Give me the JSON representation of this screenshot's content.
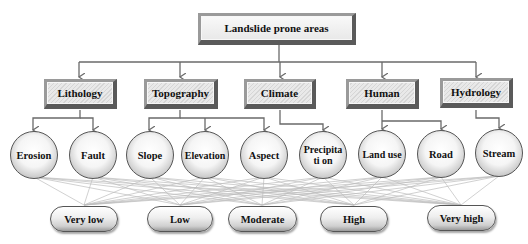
{
  "root": {
    "label": "Landslide prone areas"
  },
  "categories": [
    {
      "label": "Lithology"
    },
    {
      "label": "Topography"
    },
    {
      "label": "Climate"
    },
    {
      "label": "Human"
    },
    {
      "label": "Hydrology"
    }
  ],
  "factors": [
    {
      "label": "Erosion",
      "category": "Lithology"
    },
    {
      "label": "Fault",
      "category": "Lithology"
    },
    {
      "label": "Slope",
      "category": "Topography"
    },
    {
      "label": "Elevation",
      "category": "Topography"
    },
    {
      "label": "Aspect",
      "category": "Topography"
    },
    {
      "label": "Precipitati on",
      "category": "Climate"
    },
    {
      "label": "Land use",
      "category": "Human"
    },
    {
      "label": "Road",
      "category": "Human"
    },
    {
      "label": "Stream",
      "category": "Hydrology"
    }
  ],
  "classes": [
    {
      "label": "Very low"
    },
    {
      "label": "Low"
    },
    {
      "label": "Moderate"
    },
    {
      "label": "High"
    },
    {
      "label": "Very high"
    }
  ],
  "colors": {
    "connector": "#6a6a6a",
    "mesh": "#b8b8b8"
  }
}
